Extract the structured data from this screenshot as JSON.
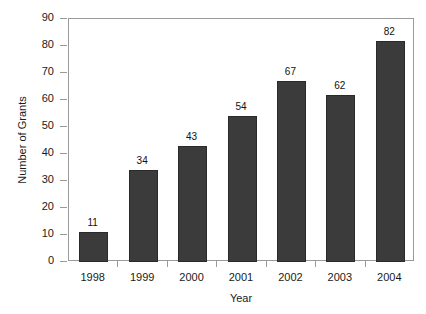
{
  "chart_data": {
    "type": "bar",
    "title": "",
    "xlabel": "Year",
    "ylabel": "Number of Grants",
    "categories": [
      "1998",
      "1999",
      "2000",
      "2001",
      "2002",
      "2003",
      "2004"
    ],
    "values": [
      11,
      34,
      43,
      54,
      67,
      62,
      82
    ],
    "value_labels": [
      "11",
      "34",
      "43",
      "54",
      "67",
      "62",
      "82"
    ],
    "ylim": [
      0,
      90
    ],
    "yticks": [
      0,
      10,
      20,
      30,
      40,
      50,
      60,
      70,
      80,
      90
    ],
    "ytick_labels": [
      "0",
      "10",
      "20",
      "30",
      "40",
      "50",
      "60",
      "70",
      "80",
      "90"
    ],
    "grid": false,
    "legend": null,
    "bar_color": "#3b3b3b",
    "frame_color": "#9a9a9a",
    "background": "#ffffff"
  }
}
